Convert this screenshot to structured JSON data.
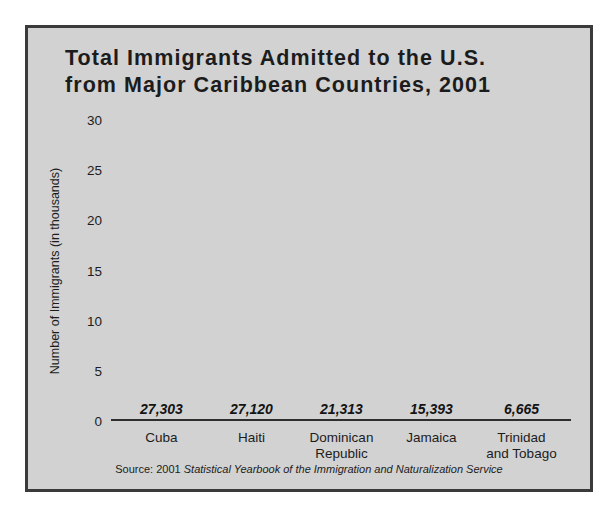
{
  "chart_data": {
    "type": "bar",
    "title": "Total Immigrants Admitted to the U.S.\nfrom Major Caribbean Countries, 2001",
    "title_line1": "Total Immigrants Admitted to the U.S.",
    "title_line2": "from Major Caribbean Countries, 2001",
    "categories": [
      "Cuba",
      "Haiti",
      "Dominican\nRepublic",
      "Jamaica",
      "Trinidad\nand Tobago"
    ],
    "values": [
      27303,
      21313,
      27120,
      15393,
      6665
    ],
    "series": [
      {
        "name": "Immigrants admitted, 2001",
        "values": [
          27303,
          27120,
          21313,
          15393,
          6665
        ]
      }
    ],
    "bars": [
      {
        "category": "Cuba",
        "category_display": "Cuba",
        "value": 27303,
        "value_label": "27,303"
      },
      {
        "category": "Haiti",
        "category_display": "Haiti",
        "value": 27120,
        "value_label": "27,120"
      },
      {
        "category": "Dominican Republic",
        "category_display": "Dominican\nRepublic",
        "value": 21313,
        "value_label": "21,313"
      },
      {
        "category": "Jamaica",
        "category_display": "Jamaica",
        "value": 15393,
        "value_label": "15,393"
      },
      {
        "category": "Trinidad and Tobago",
        "category_display": "Trinidad\nand Tobago",
        "value": 6665,
        "value_label": "6,665"
      }
    ],
    "xlabel": "",
    "ylabel": "Number of Immigrants (in thousands)",
    "ylim": [
      0,
      30
    ],
    "ytick_values": [
      30,
      25,
      20,
      15,
      10,
      5,
      0
    ],
    "ytick_labels": [
      "30",
      "25",
      "20",
      "15",
      "10",
      "5",
      "0"
    ],
    "y_units": "thousands",
    "grid": false,
    "legend": false,
    "value_labels_shown": true
  },
  "source": {
    "prefix": "Source: 2001 ",
    "publication": "Statistical Yearbook of the Immigration and Naturalization Service",
    "full_text": "Source: 2001 Statistical Yearbook of the Immigration and Naturalization Service"
  },
  "colors": {
    "bar": "#333333",
    "panel_background": "#d2d2d2",
    "frame_border": "#3a3a3a",
    "text": "#1c1c1c",
    "page_background": "#ffffff"
  }
}
